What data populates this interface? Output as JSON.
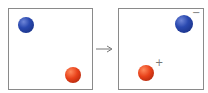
{
  "diagram": {
    "left_panel": {
      "balls": [
        {
          "color": "blue",
          "cx": 26,
          "cy": 25,
          "r": 8
        },
        {
          "color": "red",
          "cx": 73,
          "cy": 75,
          "r": 8
        }
      ]
    },
    "arrow": {
      "direction": "right"
    },
    "right_panel": {
      "balls": [
        {
          "color": "blue",
          "cx": 184,
          "cy": 24,
          "r": 9,
          "charge": "−"
        },
        {
          "color": "red",
          "cx": 146,
          "cy": 73,
          "r": 8,
          "charge": "+"
        }
      ]
    },
    "colors": {
      "blue": "#2a49b0",
      "red": "#e8411a",
      "border": "#8a8a8a"
    }
  }
}
